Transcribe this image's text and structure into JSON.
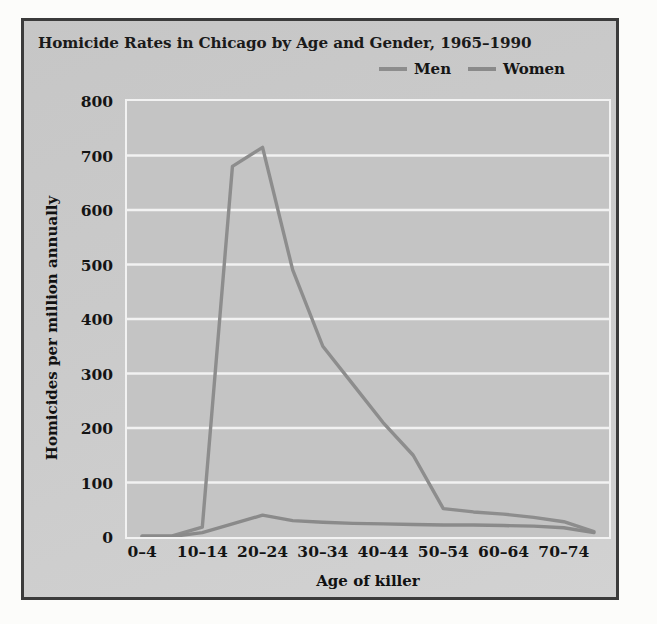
{
  "chart_data": {
    "type": "line",
    "title": "Homicide Rates in Chicago by Age and Gender, 1965–1990",
    "xlabel": "Age of killer",
    "ylabel": "Homicides per million annually",
    "categories": [
      "0–4",
      "5–9",
      "10–14",
      "15–19",
      "20–24",
      "25–29",
      "30–34",
      "35–39",
      "40–44",
      "45–49",
      "50–54",
      "55–59",
      "60–64",
      "65–69",
      "70–74",
      "75–79"
    ],
    "visible_tick_labels": [
      "0–4",
      "10–14",
      "20–24",
      "30–34",
      "40–44",
      "50–54",
      "60–64",
      "70–74"
    ],
    "visible_tick_indices": [
      0,
      2,
      4,
      6,
      8,
      10,
      12,
      14
    ],
    "series": [
      {
        "name": "Men",
        "color": "#8d8d8d",
        "values": [
          2,
          2,
          18,
          680,
          715,
          490,
          350,
          280,
          210,
          150,
          52,
          46,
          42,
          36,
          28,
          10
        ]
      },
      {
        "name": "Women",
        "color": "#8a8a8a",
        "values": [
          1,
          1,
          8,
          24,
          40,
          30,
          27,
          25,
          24,
          23,
          22,
          22,
          21,
          20,
          17,
          8
        ]
      }
    ],
    "ylim": [
      0,
      800
    ],
    "yticks": [
      0,
      100,
      200,
      300,
      400,
      500,
      600,
      700,
      800
    ],
    "ytick_labels": [
      "0",
      "100",
      "200",
      "300",
      "400",
      "500",
      "600",
      "700",
      "800"
    ],
    "grid": "horizontal",
    "grid_color": "#f2f2f2",
    "legend_position": "top-right",
    "plot_background": "#c4c4c4",
    "figure_background": "#c9c9c9",
    "frame_color": "#3b3b3b"
  }
}
